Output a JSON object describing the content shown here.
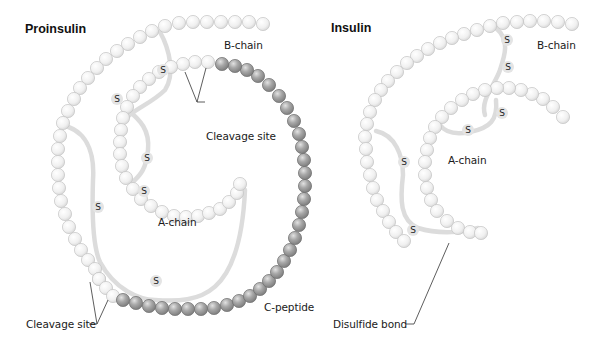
{
  "proinsulin": {
    "title": "Proinsulin",
    "labels": {
      "b_chain": "B-chain",
      "a_chain": "A-chain",
      "c_peptide": "C-peptide",
      "cleavage_site_top": "Cleavage site",
      "cleavage_site_bottom": "Cleavage site"
    }
  },
  "insulin": {
    "title": "Insulin",
    "labels": {
      "b_chain": "B-chain",
      "a_chain": "A-chain",
      "disulfide_bond": "Disulfide bond"
    }
  },
  "legend": {
    "sulfur_symbol": "S"
  },
  "colors": {
    "light_bead": "#f2f2f2",
    "light_bead_edge": "#c4c4c4",
    "dark_bead": "#9d9d9d",
    "dark_bead_edge": "#6f6f6f",
    "bond": "#dcdcdc",
    "text": "#1a1a1a"
  },
  "geometry": {
    "proinsulin_b_chain": [
      [
        263,
        24
      ],
      [
        249,
        22
      ],
      [
        235,
        22
      ],
      [
        221,
        22
      ],
      [
        207,
        22
      ],
      [
        193,
        22
      ],
      [
        179,
        23
      ],
      [
        165,
        26
      ],
      [
        152,
        31
      ],
      [
        140,
        37
      ],
      [
        128,
        44
      ],
      [
        117,
        51
      ],
      [
        106,
        59
      ],
      [
        97,
        68
      ],
      [
        88,
        78
      ],
      [
        80,
        88
      ],
      [
        74,
        99
      ],
      [
        68,
        111
      ],
      [
        63,
        123
      ],
      [
        60,
        136
      ],
      [
        58,
        149
      ],
      [
        58,
        162
      ],
      [
        58,
        175
      ],
      [
        59,
        188
      ],
      [
        61,
        201
      ],
      [
        65,
        214
      ],
      [
        69,
        227
      ],
      [
        75,
        239
      ],
      [
        81,
        250
      ],
      [
        88,
        260
      ],
      [
        95,
        269
      ],
      [
        99,
        279
      ]
    ],
    "proinsulin_cleave_bottom": [
      [
        99,
        279
      ],
      [
        106,
        288
      ],
      [
        113,
        296
      ]
    ],
    "proinsulin_c_peptide_dark": [
      [
        123,
        300
      ],
      [
        136,
        303
      ],
      [
        149,
        306
      ],
      [
        162,
        308
      ],
      [
        175,
        309
      ],
      [
        188,
        309
      ],
      [
        201,
        309
      ],
      [
        214,
        308
      ],
      [
        227,
        305
      ],
      [
        239,
        301
      ],
      [
        250,
        296
      ],
      [
        260,
        289
      ],
      [
        269,
        281
      ],
      [
        277,
        272
      ],
      [
        284,
        261
      ],
      [
        290,
        250
      ],
      [
        295,
        238
      ],
      [
        299,
        225
      ],
      [
        302,
        212
      ],
      [
        304,
        199
      ],
      [
        305,
        186
      ],
      [
        305,
        173
      ],
      [
        304,
        160
      ],
      [
        302,
        147
      ],
      [
        299,
        134
      ],
      [
        294,
        121
      ],
      [
        287,
        108
      ],
      [
        279,
        96
      ],
      [
        269,
        85
      ],
      [
        258,
        76
      ],
      [
        247,
        70
      ],
      [
        235,
        66
      ],
      [
        222,
        64
      ]
    ],
    "proinsulin_cleave_top": [
      [
        208,
        62
      ],
      [
        195,
        62
      ]
    ],
    "proinsulin_a_chain": [
      [
        183,
        64
      ],
      [
        171,
        67
      ],
      [
        159,
        72
      ],
      [
        149,
        79
      ],
      [
        140,
        87
      ],
      [
        133,
        96
      ],
      [
        127,
        107
      ],
      [
        123,
        118
      ],
      [
        121,
        130
      ],
      [
        120,
        142
      ],
      [
        120,
        154
      ],
      [
        122,
        166
      ],
      [
        126,
        178
      ],
      [
        133,
        189
      ],
      [
        141,
        199
      ],
      [
        151,
        206
      ],
      [
        162,
        212
      ],
      [
        174,
        216
      ],
      [
        186,
        217
      ],
      [
        198,
        216
      ],
      [
        209,
        213
      ],
      [
        220,
        209
      ],
      [
        229,
        202
      ],
      [
        237,
        193
      ],
      [
        240,
        184
      ]
    ],
    "proinsulin_bonds": [
      "M160,32 C170,50 175,75 165,90 C150,105 130,110 120,125",
      "M62,125 C85,130 95,150 93,180 C92,210 92,245 100,262 C115,290 140,300 155,300 C200,303 240,298 245,190",
      "M128,110 C140,120 150,130 148,150 C146,170 140,175 133,182"
    ],
    "proinsulin_sulfur": [
      [
        163,
        70
      ],
      [
        117,
        99
      ],
      [
        147,
        158
      ],
      [
        144,
        191
      ],
      [
        98,
        207
      ],
      [
        156,
        281
      ]
    ],
    "insulin_b_chain": [
      [
        572,
        24
      ],
      [
        558,
        22
      ],
      [
        544,
        21
      ],
      [
        530,
        21
      ],
      [
        517,
        22
      ],
      [
        503,
        23
      ],
      [
        490,
        26
      ],
      [
        477,
        30
      ],
      [
        464,
        34
      ],
      [
        452,
        38
      ],
      [
        440,
        43
      ],
      [
        428,
        49
      ],
      [
        417,
        56
      ],
      [
        407,
        63
      ],
      [
        397,
        72
      ],
      [
        388,
        81
      ],
      [
        381,
        90
      ],
      [
        375,
        100
      ],
      [
        370,
        112
      ],
      [
        367,
        124
      ],
      [
        365,
        137
      ],
      [
        366,
        149
      ],
      [
        367,
        162
      ],
      [
        370,
        175
      ],
      [
        373,
        188
      ],
      [
        377,
        200
      ],
      [
        383,
        211
      ],
      [
        389,
        222
      ],
      [
        396,
        232
      ],
      [
        404,
        241
      ]
    ],
    "insulin_a_chain": [
      [
        563,
        117
      ],
      [
        553,
        107
      ],
      [
        543,
        99
      ],
      [
        532,
        94
      ],
      [
        521,
        90
      ],
      [
        509,
        88
      ],
      [
        497,
        88
      ],
      [
        485,
        90
      ],
      [
        473,
        94
      ],
      [
        462,
        100
      ],
      [
        451,
        108
      ],
      [
        442,
        117
      ],
      [
        435,
        127
      ],
      [
        430,
        138
      ],
      [
        427,
        150
      ],
      [
        425,
        162
      ],
      [
        425,
        175
      ],
      [
        427,
        188
      ],
      [
        431,
        200
      ],
      [
        437,
        211
      ],
      [
        447,
        221
      ],
      [
        458,
        228
      ],
      [
        470,
        232
      ],
      [
        481,
        233
      ]
    ],
    "insulin_bonds": [
      "M496,28 C510,40 505,55 500,70 C495,85 480,100 485,115",
      "M496,100 C498,120 490,128 470,132 C455,135 445,132 440,125",
      "M376,131 C395,135 403,155 403,175 C400,200 400,220 418,228 C440,235 465,232 478,228"
    ],
    "insulin_sulfur": [
      [
        507,
        40
      ],
      [
        508,
        67
      ],
      [
        502,
        113
      ],
      [
        468,
        130
      ],
      [
        404,
        162
      ],
      [
        413,
        230
      ]
    ]
  }
}
